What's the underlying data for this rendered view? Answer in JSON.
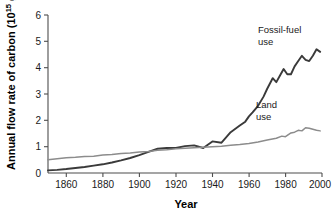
{
  "chart_data": {
    "type": "line",
    "title": "",
    "xlabel": "Year",
    "ylabel": "Annual flow rate of carbon (10¹⁵ g)",
    "ylabel_main": "Annual flow rate of carbon (10",
    "ylabel_exponent": "15",
    "ylabel_tail": " g)",
    "xlim": [
      1850,
      2000
    ],
    "ylim": [
      0,
      6
    ],
    "grid": false,
    "legend_position": "inline-annotations",
    "xticks": [
      1860,
      1880,
      1900,
      1920,
      1940,
      1960,
      1980,
      2000
    ],
    "xtick_labels": [
      "1860",
      "1880",
      "1900",
      "1920",
      "1940",
      "1960",
      "1980",
      "2000"
    ],
    "yticks": [
      0,
      1,
      2,
      3,
      4,
      5,
      6
    ],
    "ytick_labels": [
      "0",
      "1",
      "2",
      "3",
      "4",
      "5",
      "6"
    ],
    "annotations": [
      {
        "name": "fossil-fuel-use-label",
        "text_line1": "Fossil-fuel",
        "text_line2": "use",
        "x": 1964,
        "y": 5.05
      },
      {
        "name": "land-use-label",
        "text_line1": "Land",
        "text_line2": "use",
        "x": 1962,
        "y": 2.55
      }
    ],
    "series": [
      {
        "name": "Fossil-fuel use",
        "color": "#3a3a3a",
        "width": 1.9,
        "x": [
          1850,
          1855,
          1860,
          1865,
          1870,
          1875,
          1880,
          1885,
          1890,
          1895,
          1900,
          1905,
          1910,
          1915,
          1920,
          1925,
          1930,
          1935,
          1940,
          1945,
          1950,
          1955,
          1958,
          1960,
          1962,
          1965,
          1968,
          1970,
          1973,
          1975,
          1977,
          1979,
          1981,
          1983,
          1985,
          1987,
          1989,
          1991,
          1993,
          1995,
          1997,
          1999
        ],
        "values": [
          0.1,
          0.12,
          0.15,
          0.19,
          0.23,
          0.28,
          0.33,
          0.4,
          0.48,
          0.57,
          0.68,
          0.8,
          0.92,
          0.95,
          0.95,
          1.02,
          1.05,
          0.95,
          1.2,
          1.15,
          1.55,
          1.8,
          1.95,
          2.15,
          2.3,
          2.55,
          2.9,
          3.2,
          3.6,
          3.45,
          3.7,
          3.95,
          3.75,
          3.75,
          4.05,
          4.25,
          4.45,
          4.3,
          4.25,
          4.45,
          4.7,
          4.6
        ]
      },
      {
        "name": "Land use",
        "color": "#8c8c8c",
        "width": 1.5,
        "x": [
          1850,
          1855,
          1860,
          1865,
          1870,
          1875,
          1880,
          1885,
          1890,
          1895,
          1900,
          1905,
          1910,
          1915,
          1920,
          1925,
          1930,
          1935,
          1940,
          1945,
          1950,
          1955,
          1960,
          1965,
          1970,
          1975,
          1978,
          1980,
          1983,
          1985,
          1987,
          1989,
          1991,
          1993,
          1995,
          1997,
          1999
        ],
        "values": [
          0.5,
          0.54,
          0.58,
          0.6,
          0.63,
          0.64,
          0.68,
          0.7,
          0.74,
          0.76,
          0.8,
          0.82,
          0.86,
          0.88,
          0.92,
          0.94,
          0.96,
          0.98,
          1.0,
          1.02,
          1.05,
          1.08,
          1.12,
          1.18,
          1.25,
          1.32,
          1.4,
          1.38,
          1.52,
          1.55,
          1.62,
          1.6,
          1.72,
          1.7,
          1.66,
          1.62,
          1.6
        ]
      }
    ]
  },
  "axes": {
    "x_title": "Year",
    "y_title_prefix": "Annual flow rate of carbon (10",
    "y_title_sup": "15",
    "y_title_suffix": " g)"
  }
}
